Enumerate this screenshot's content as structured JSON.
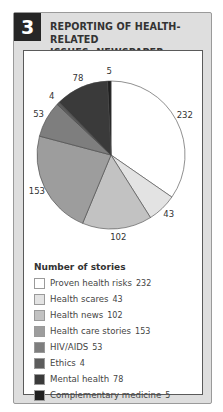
{
  "header": {
    "number": "3",
    "title_line1": "REPORTING OF HEALTH-RELATED",
    "title_line2": "ISSUES: NEWSPAPER FEATURES"
  },
  "legend": {
    "title": "Number of stories",
    "items": [
      {
        "label": "Proven health risks",
        "value": "232",
        "color": "#ffffff"
      },
      {
        "label": "Health scares",
        "value": "43",
        "color": "#e3e3e3"
      },
      {
        "label": "Health news",
        "value": "102",
        "color": "#c2c2c2"
      },
      {
        "label": "Health care stories",
        "value": "153",
        "color": "#9d9d9d"
      },
      {
        "label": "HIV/AIDS",
        "value": "53",
        "color": "#7e7e7e"
      },
      {
        "label": "Ethics",
        "value": "4",
        "color": "#5c5c5c"
      },
      {
        "label": "Mental health",
        "value": "78",
        "color": "#3a3a3a"
      },
      {
        "label": "Complementary medicine",
        "value": "5",
        "color": "#1f1f1f"
      }
    ]
  },
  "chart_data": {
    "type": "pie",
    "title": "Reporting of health-related issues: newspaper features",
    "legend_title": "Number of stories",
    "legend_position": "bottom",
    "categories": [
      "Proven health risks",
      "Health scares",
      "Health news",
      "Health care stories",
      "HIV/AIDS",
      "Ethics",
      "Mental health",
      "Complementary medicine"
    ],
    "values": [
      232,
      43,
      102,
      153,
      53,
      4,
      78,
      5
    ],
    "colors": [
      "#ffffff",
      "#e3e3e3",
      "#c2c2c2",
      "#9d9d9d",
      "#7e7e7e",
      "#5c5c5c",
      "#3a3a3a",
      "#1f1f1f"
    ],
    "start_angle_deg": 0,
    "direction": "clockwise"
  }
}
